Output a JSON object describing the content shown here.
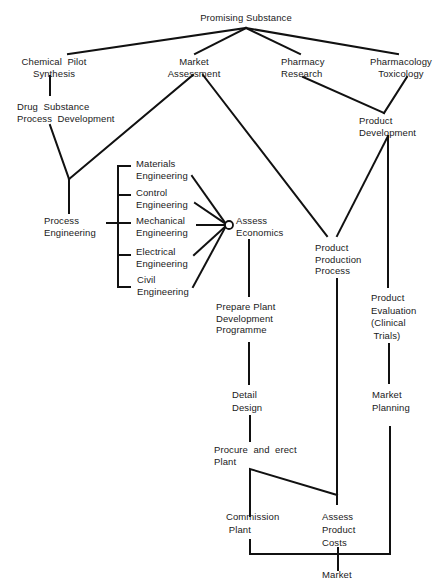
{
  "diagram": {
    "type": "flowchart",
    "colors": {
      "line": "#111111",
      "text": "#1a1a1a",
      "background": "#ffffff"
    },
    "nodes": {
      "promising_substance": "Promising Substance",
      "chemical_pilot_synthesis": "Chemical  Pilot\nSynthesis",
      "market_assessment": "Market\nAssessment",
      "pharmacy_research": "Pharmacy\nResearch",
      "pharmacology_toxicology": "Pharmacology\nToxicology",
      "drug_substance_process_development": "Drug  Substance\nProcess  Development",
      "product_development": "Product\nDevelopment",
      "process_engineering": "Process\nEngineering",
      "materials_engineering": "Materials\nEngineering",
      "control_engineering": "Control\nEngineering",
      "mechanical_engineering": "Mechanical\nEngineering",
      "electrical_engineering": "Electrical\nEngineering",
      "civil_engineering": "Civil\nEngineering",
      "assess_economics": "Assess\nEconomics",
      "product_production_process": "Product\nProduction\nProcess",
      "prepare_plant_development_programme": "Prepare Plant\nDevelopment\nProgramme",
      "product_evaluation": "Product\nEvaluation\n(Clinical\n Trials)",
      "detail_design": "Detail\nDesign",
      "market_planning": "Market\nPlanning",
      "procure_and_erect_plant": "Procure  and  erect\nPlant",
      "commission_plant": "Commission\n Plant",
      "assess_product_costs": "Assess\nProduct\nCosts",
      "market": "Market"
    },
    "edges": [
      [
        "Promising Substance",
        "Chemical Pilot Synthesis"
      ],
      [
        "Promising Substance",
        "Market Assessment"
      ],
      [
        "Promising Substance",
        "Pharmacy Research"
      ],
      [
        "Promising Substance",
        "Pharmacology Toxicology"
      ],
      [
        "Chemical Pilot Synthesis",
        "Drug Substance Process Development"
      ],
      [
        "Drug Substance Process Development",
        "Process Engineering"
      ],
      [
        "Market Assessment",
        "Process Engineering"
      ],
      [
        "Market Assessment",
        "Product Production Process"
      ],
      [
        "Pharmacy Research",
        "Product Development"
      ],
      [
        "Pharmacology Toxicology",
        "Product Development"
      ],
      [
        "Product Development",
        "Product Production Process"
      ],
      [
        "Product Development",
        "Product Evaluation (Clinical Trials)"
      ],
      [
        "Process Engineering",
        "Materials Engineering"
      ],
      [
        "Process Engineering",
        "Control Engineering"
      ],
      [
        "Process Engineering",
        "Mechanical Engineering"
      ],
      [
        "Process Engineering",
        "Electrical Engineering"
      ],
      [
        "Process Engineering",
        "Civil Engineering"
      ],
      [
        "Materials Engineering",
        "Assess Economics"
      ],
      [
        "Control Engineering",
        "Assess Economics"
      ],
      [
        "Mechanical Engineering",
        "Assess Economics"
      ],
      [
        "Electrical Engineering",
        "Assess Economics"
      ],
      [
        "Civil Engineering",
        "Assess Economics"
      ],
      [
        "Assess Economics",
        "Prepare Plant Development Programme"
      ],
      [
        "Prepare Plant Development Programme",
        "Detail Design"
      ],
      [
        "Detail Design",
        "Procure and erect Plant"
      ],
      [
        "Procure and erect Plant",
        "Commission Plant"
      ],
      [
        "Procure and erect Plant",
        "Assess Product Costs"
      ],
      [
        "Product Production Process",
        "Assess Product Costs"
      ],
      [
        "Product Evaluation (Clinical Trials)",
        "Market Planning"
      ],
      [
        "Commission Plant",
        "Market"
      ],
      [
        "Assess Product Costs",
        "Market"
      ],
      [
        "Market Planning",
        "Market"
      ]
    ]
  }
}
